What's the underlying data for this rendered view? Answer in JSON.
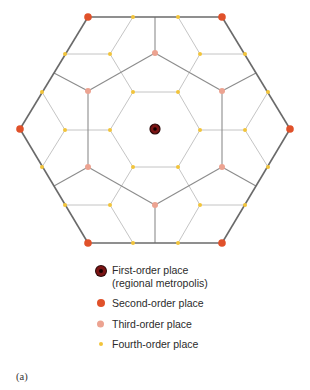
{
  "colors": {
    "first_order": "#7a1414",
    "second_order": "#e0512a",
    "third_order": "#eca391",
    "fourth_order": "#f2c43a",
    "outer_boundary": "#6a6a6a",
    "third_order_boundary": "#8c8c8c",
    "fourth_order_boundary": "#bdbdbd"
  },
  "legend": {
    "first_order_line1": "First-order place",
    "first_order_line2": "(regional metropolis)",
    "second_order": "Second-order place",
    "third_order": "Third-order place",
    "fourth_order": "Fourth-order place"
  },
  "caption": "(a)",
  "nodes": {
    "first_order": [
      [
        155,
        129
      ]
    ],
    "second_order": [
      [
        88,
        17
      ],
      [
        222,
        17
      ],
      [
        20,
        129
      ],
      [
        290,
        129
      ],
      [
        88,
        243
      ],
      [
        222,
        243
      ]
    ],
    "third_order": [
      [
        155,
        53
      ],
      [
        88,
        91
      ],
      [
        222,
        91
      ],
      [
        88,
        167
      ],
      [
        222,
        167
      ],
      [
        155,
        205
      ]
    ],
    "fourth_order": [
      [
        133,
        17
      ],
      [
        178,
        17
      ],
      [
        65,
        54
      ],
      [
        110,
        54
      ],
      [
        200,
        54
      ],
      [
        245,
        54
      ],
      [
        42,
        92
      ],
      [
        133,
        92
      ],
      [
        178,
        92
      ],
      [
        268,
        92
      ],
      [
        65,
        130
      ],
      [
        110,
        130
      ],
      [
        200,
        130
      ],
      [
        245,
        130
      ],
      [
        42,
        167
      ],
      [
        133,
        167
      ],
      [
        178,
        167
      ],
      [
        268,
        167
      ],
      [
        65,
        205
      ],
      [
        110,
        205
      ],
      [
        200,
        205
      ],
      [
        245,
        205
      ],
      [
        133,
        243
      ],
      [
        178,
        243
      ]
    ]
  },
  "edges": {
    "outer_boundary": [
      [
        [
          88,
          17
        ],
        [
          222,
          17
        ]
      ],
      [
        [
          222,
          17
        ],
        [
          290,
          129
        ]
      ],
      [
        [
          290,
          129
        ],
        [
          222,
          243
        ]
      ],
      [
        [
          222,
          243
        ],
        [
          88,
          243
        ]
      ],
      [
        [
          88,
          243
        ],
        [
          20,
          129
        ]
      ],
      [
        [
          20,
          129
        ],
        [
          88,
          17
        ]
      ]
    ],
    "third_order_boundary": [
      [
        [
          155,
          53
        ],
        [
          155,
          17
        ]
      ],
      [
        [
          155,
          53
        ],
        [
          88,
          91
        ]
      ],
      [
        [
          155,
          53
        ],
        [
          222,
          91
        ]
      ],
      [
        [
          88,
          91
        ],
        [
          54,
          73
        ]
      ],
      [
        [
          88,
          91
        ],
        [
          88,
          167
        ]
      ],
      [
        [
          222,
          91
        ],
        [
          256,
          73
        ]
      ],
      [
        [
          222,
          91
        ],
        [
          222,
          167
        ]
      ],
      [
        [
          88,
          167
        ],
        [
          54,
          186
        ]
      ],
      [
        [
          88,
          167
        ],
        [
          155,
          205
        ]
      ],
      [
        [
          222,
          167
        ],
        [
          256,
          186
        ]
      ],
      [
        [
          222,
          167
        ],
        [
          155,
          205
        ]
      ],
      [
        [
          155,
          205
        ],
        [
          155,
          243
        ]
      ]
    ],
    "fourth_order_boundary": [
      [
        [
          133,
          92
        ],
        [
          178,
          92
        ]
      ],
      [
        [
          178,
          92
        ],
        [
          200,
          130
        ]
      ],
      [
        [
          200,
          130
        ],
        [
          178,
          167
        ]
      ],
      [
        [
          178,
          167
        ],
        [
          133,
          167
        ]
      ],
      [
        [
          133,
          167
        ],
        [
          110,
          130
        ]
      ],
      [
        [
          110,
          130
        ],
        [
          133,
          92
        ]
      ],
      [
        [
          133,
          17
        ],
        [
          110,
          54
        ]
      ],
      [
        [
          110,
          54
        ],
        [
          65,
          54
        ]
      ],
      [
        [
          110,
          54
        ],
        [
          133,
          92
        ]
      ],
      [
        [
          178,
          17
        ],
        [
          200,
          54
        ]
      ],
      [
        [
          200,
          54
        ],
        [
          245,
          54
        ]
      ],
      [
        [
          200,
          54
        ],
        [
          178,
          92
        ]
      ],
      [
        [
          42,
          92
        ],
        [
          65,
          130
        ]
      ],
      [
        [
          65,
          130
        ],
        [
          42,
          167
        ]
      ],
      [
        [
          65,
          130
        ],
        [
          110,
          130
        ]
      ],
      [
        [
          268,
          92
        ],
        [
          245,
          130
        ]
      ],
      [
        [
          245,
          130
        ],
        [
          268,
          167
        ]
      ],
      [
        [
          245,
          130
        ],
        [
          200,
          130
        ]
      ],
      [
        [
          133,
          243
        ],
        [
          110,
          205
        ]
      ],
      [
        [
          110,
          205
        ],
        [
          65,
          205
        ]
      ],
      [
        [
          110,
          205
        ],
        [
          133,
          167
        ]
      ],
      [
        [
          178,
          243
        ],
        [
          200,
          205
        ]
      ],
      [
        [
          200,
          205
        ],
        [
          245,
          205
        ]
      ],
      [
        [
          200,
          205
        ],
        [
          178,
          167
        ]
      ]
    ]
  }
}
